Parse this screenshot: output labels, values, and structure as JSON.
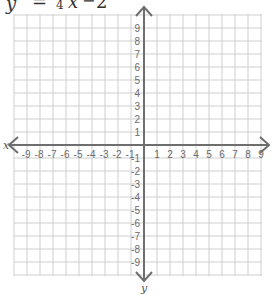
{
  "equation": {
    "y": "y",
    "equals": "=",
    "denominator": "4",
    "x": "x",
    "minus": "−",
    "constant": "2"
  },
  "graph": {
    "x_axis_label": "x",
    "y_axis_label": "y",
    "x_range": [
      -9,
      9
    ],
    "y_range": [
      -9,
      9
    ],
    "grid": true,
    "colors": {
      "grid": "#cfcfcf",
      "axis": "#6e6e6e",
      "tick_text": "#6b6b6b"
    }
  },
  "chart_data": {
    "type": "line",
    "xlabel": "x",
    "ylabel": "y",
    "xlim": [
      -9,
      9
    ],
    "ylim": [
      -9,
      9
    ],
    "x_ticks": [
      -9,
      -8,
      -7,
      -6,
      -5,
      -4,
      -3,
      -2,
      -1,
      1,
      2,
      3,
      4,
      5,
      6,
      7,
      8,
      9
    ],
    "y_ticks": [
      9,
      8,
      7,
      6,
      5,
      4,
      3,
      2,
      1,
      -1,
      -2,
      -3,
      -4,
      -5,
      -6,
      -7,
      -8,
      -9
    ],
    "grid": true,
    "series": []
  }
}
